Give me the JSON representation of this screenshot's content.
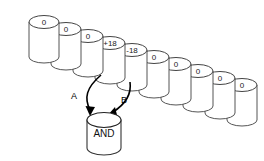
{
  "diagram": {
    "background_color": "#ffffff",
    "outline_color": "#555555",
    "arrow_color": "#000000",
    "text_color": "#1a1a1a"
  },
  "cylinders": [
    {
      "id": "cyl-1",
      "label": "0",
      "x": 44,
      "y": 22
    },
    {
      "id": "cyl-2",
      "label": "0",
      "x": 66,
      "y": 29
    },
    {
      "id": "cyl-3",
      "label": "0",
      "x": 88,
      "y": 36
    },
    {
      "id": "cyl-4",
      "label": "+18",
      "x": 110,
      "y": 43
    },
    {
      "id": "cyl-5",
      "label": "-18",
      "x": 132,
      "y": 50
    },
    {
      "id": "cyl-6",
      "label": "0",
      "x": 154,
      "y": 57
    },
    {
      "id": "cyl-7",
      "label": "0",
      "x": 176,
      "y": 64
    },
    {
      "id": "cyl-8",
      "label": "0",
      "x": 198,
      "y": 71
    },
    {
      "id": "cyl-9",
      "label": "0",
      "x": 220,
      "y": 78
    },
    {
      "id": "cyl-10",
      "label": "0",
      "x": 242,
      "y": 85
    }
  ],
  "and_node": {
    "label": "AND",
    "x": 104,
    "y": 128
  },
  "edges": [
    {
      "id": "edge-a",
      "label": "A",
      "from": "cyl-4",
      "to": "and_node",
      "label_x": 74,
      "label_y": 97
    },
    {
      "id": "edge-b",
      "label": "B",
      "from": "cyl-5",
      "to": "and_node",
      "label_x": 124,
      "label_y": 101
    }
  ]
}
